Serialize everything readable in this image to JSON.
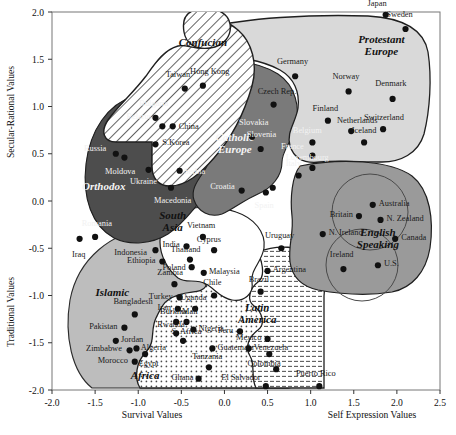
{
  "chart_data": {
    "type": "scatter",
    "title": "",
    "xlabel_left": "Survival Values",
    "xlabel_right": "Self Expression Values",
    "ylabel_top": "Secular-Rational Values",
    "ylabel_bottom": "Traditional Values",
    "xlim": [
      -2.0,
      2.5
    ],
    "ylim": [
      -2.0,
      2.0
    ],
    "xticks": [
      "-2.0",
      "-1.5",
      "-1.0",
      "-0.5",
      "0.0",
      "0.5",
      "1.0",
      "1.5",
      "2.0",
      "2.5"
    ],
    "xtick_values": [
      -2.0,
      -1.5,
      -1.0,
      -0.5,
      0.0,
      0.5,
      1.0,
      1.5,
      2.0,
      2.5
    ],
    "yticks": [
      "2.0",
      "1.5",
      "1.0",
      "0.5",
      "0.0",
      "-0.5",
      "-1.0",
      "-1.5",
      "-2.0"
    ],
    "ytick_values": [
      2.0,
      1.5,
      1.0,
      0.5,
      0.0,
      -0.5,
      -1.0,
      -1.5,
      -2.0
    ],
    "grid": false,
    "legend": "none",
    "groups": [
      {
        "name": "Confucian",
        "label_x": -0.25,
        "label_y": 1.64,
        "fill": "hatch",
        "label_color": "dark"
      },
      {
        "name": "Protestant Europe",
        "label_x": 1.82,
        "label_y": 1.62,
        "fill": "#d9d9d9",
        "label_color": "dark"
      },
      {
        "name": "Catholic Europe",
        "label_x": 0.12,
        "label_y": 0.58,
        "fill": "#7a7a7a",
        "label_color": "light"
      },
      {
        "name": "Orthodox",
        "label_x": -1.4,
        "label_y": 0.12,
        "fill": "#4d4d4d",
        "label_color": "light"
      },
      {
        "name": "English Speaking",
        "label_x": 1.78,
        "label_y": -0.42,
        "fill": "#9a9a9a",
        "label_color": "dark"
      },
      {
        "name": "South Asia",
        "label_x": -0.6,
        "label_y": -0.24,
        "fill": "#ffffff",
        "label_color": "dark"
      },
      {
        "name": "Islamic",
        "label_x": -1.3,
        "label_y": -1.0,
        "fill": "#bdbdbd",
        "label_color": "dark"
      },
      {
        "name": "Latin America",
        "label_x": 0.38,
        "label_y": -1.22,
        "fill": "#efefef",
        "label_color": "dark"
      },
      {
        "name": "Africa",
        "label_x": -0.92,
        "label_y": -1.88,
        "fill": "#e5e5e5",
        "label_color": "dark"
      }
    ],
    "points": [
      {
        "country": "Japan",
        "x": 1.87,
        "y": 1.97,
        "lx": -0.1,
        "ly": 0.13,
        "anchor": "middle",
        "color": "dark"
      },
      {
        "country": "Sweden",
        "x": 2.1,
        "y": 1.82,
        "lx": -0.07,
        "ly": 0.16,
        "anchor": "middle",
        "color": "dark"
      },
      {
        "country": "Taiwan",
        "x": -0.46,
        "y": 1.19,
        "lx": -0.08,
        "ly": 0.16,
        "anchor": "middle",
        "color": "dark"
      },
      {
        "country": "Hong Kong",
        "x": -0.25,
        "y": 1.22,
        "lx": 0.08,
        "ly": 0.16,
        "anchor": "middle",
        "color": "dark"
      },
      {
        "country": "Germany",
        "x": 0.82,
        "y": 1.32,
        "lx": -0.03,
        "ly": 0.16,
        "anchor": "middle",
        "color": "dark"
      },
      {
        "country": "Norway",
        "x": 1.44,
        "y": 1.16,
        "lx": -0.03,
        "ly": 0.16,
        "anchor": "middle",
        "color": "dark"
      },
      {
        "country": "Denmark",
        "x": 1.95,
        "y": 1.08,
        "lx": -0.02,
        "ly": 0.17,
        "anchor": "middle",
        "color": "dark"
      },
      {
        "country": "Czech Rep.",
        "x": 0.57,
        "y": 1.02,
        "lx": 0.04,
        "ly": 0.14,
        "anchor": "middle",
        "color": "dark"
      },
      {
        "country": "Bulgaria",
        "x": -0.8,
        "y": 0.88,
        "lx": -0.02,
        "ly": 0.16,
        "anchor": "middle",
        "color": "light"
      },
      {
        "country": "Belarus",
        "x": -0.72,
        "y": 0.79,
        "lx": -0.12,
        "ly": 0.11,
        "anchor": "end",
        "color": "light"
      },
      {
        "country": "China",
        "x": -0.6,
        "y": 0.79,
        "lx": 0.07,
        "ly": 0.0,
        "anchor": "start",
        "color": "dark"
      },
      {
        "country": "Slovakia",
        "x": 0.32,
        "y": 0.68,
        "lx": 0.02,
        "ly": 0.16,
        "anchor": "middle",
        "color": "light"
      },
      {
        "country": "Slovenia",
        "x": 0.42,
        "y": 0.55,
        "lx": 0.01,
        "ly": 0.16,
        "anchor": "middle",
        "color": "light"
      },
      {
        "country": "Finland",
        "x": 1.2,
        "y": 0.85,
        "lx": -0.03,
        "ly": 0.14,
        "anchor": "middle",
        "color": "dark"
      },
      {
        "country": "Netherlands",
        "x": 1.47,
        "y": 0.74,
        "lx": 0.07,
        "ly": 0.12,
        "anchor": "middle",
        "color": "dark"
      },
      {
        "country": "Switzerland",
        "x": 1.84,
        "y": 0.76,
        "lx": 0.01,
        "ly": 0.13,
        "anchor": "middle",
        "color": "dark"
      },
      {
        "country": "Iceland",
        "x": 1.62,
        "y": 0.62,
        "lx": 0.0,
        "ly": 0.13,
        "anchor": "middle",
        "color": "dark"
      },
      {
        "country": "Belgium",
        "x": 1.02,
        "y": 0.62,
        "lx": -0.06,
        "ly": 0.13,
        "anchor": "middle",
        "color": "light"
      },
      {
        "country": "France",
        "x": 1.02,
        "y": 0.48,
        "lx": -0.1,
        "ly": 0.1,
        "anchor": "end",
        "color": "light"
      },
      {
        "country": "Luxembourg",
        "x": 1.02,
        "y": 0.35,
        "lx": -0.06,
        "ly": 0.12,
        "anchor": "middle",
        "color": "light"
      },
      {
        "country": "Russia",
        "x": -1.26,
        "y": 0.5,
        "lx": -0.11,
        "ly": 0.06,
        "anchor": "end",
        "color": "light"
      },
      {
        "country": "S.Korea",
        "x": -0.8,
        "y": 0.6,
        "lx": 0.08,
        "ly": 0.02,
        "anchor": "start",
        "color": "dark"
      },
      {
        "country": "Moldova",
        "x": -1.16,
        "y": 0.46,
        "lx": -0.05,
        "ly": -0.14,
        "anchor": "middle",
        "color": "light"
      },
      {
        "country": "Ukraine",
        "x": -0.88,
        "y": 0.33,
        "lx": -0.06,
        "ly": -0.12,
        "anchor": "middle",
        "color": "light"
      },
      {
        "country": "Serbia",
        "x": -0.52,
        "y": 0.32,
        "lx": 0.05,
        "ly": 0.0,
        "anchor": "start",
        "color": "light"
      },
      {
        "country": "Macedonia",
        "x": -0.62,
        "y": 0.14,
        "lx": 0.02,
        "ly": -0.13,
        "anchor": "middle",
        "color": "light"
      },
      {
        "country": "Italy",
        "x": 0.86,
        "y": 0.27,
        "lx": -0.06,
        "ly": 0.13,
        "anchor": "middle",
        "color": "light"
      },
      {
        "country": "Croatia",
        "x": 0.2,
        "y": 0.11,
        "lx": -0.08,
        "ly": 0.05,
        "anchor": "end",
        "color": "light"
      },
      {
        "country": "Spain",
        "x": 0.48,
        "y": 0.09,
        "lx": -0.02,
        "ly": -0.13,
        "anchor": "middle",
        "color": "light"
      },
      {
        "country": "Spain2",
        "x": 0.56,
        "y": 0.14,
        "lx": 0.0,
        "ly": 0.0,
        "anchor": "middle",
        "color": "none"
      },
      {
        "country": "Britain",
        "x": 1.56,
        "y": -0.16,
        "lx": -0.07,
        "ly": 0.02,
        "anchor": "end",
        "color": "dark"
      },
      {
        "country": "Australia",
        "x": 1.72,
        "y": -0.04,
        "lx": 0.07,
        "ly": 0.02,
        "anchor": "start",
        "color": "dark"
      },
      {
        "country": "N. Zealand",
        "x": 1.81,
        "y": -0.2,
        "lx": 0.07,
        "ly": 0.02,
        "anchor": "start",
        "color": "dark"
      },
      {
        "country": "Canada",
        "x": 1.98,
        "y": -0.4,
        "lx": 0.07,
        "ly": 0.02,
        "anchor": "start",
        "color": "dark"
      },
      {
        "country": "N. Ireland",
        "x": 1.14,
        "y": -0.35,
        "lx": 0.07,
        "ly": 0.02,
        "anchor": "start",
        "color": "dark"
      },
      {
        "country": "Ireland",
        "x": 1.38,
        "y": -0.72,
        "lx": -0.02,
        "ly": 0.16,
        "anchor": "middle",
        "color": "dark"
      },
      {
        "country": "U.S.",
        "x": 1.78,
        "y": -0.68,
        "lx": 0.07,
        "ly": 0.02,
        "anchor": "start",
        "color": "dark"
      },
      {
        "country": "Romania",
        "x": -1.5,
        "y": -0.38,
        "lx": 0.02,
        "ly": 0.15,
        "anchor": "middle",
        "color": "light"
      },
      {
        "country": "Iraq",
        "x": -1.68,
        "y": -0.4,
        "lx": -0.01,
        "ly": -0.16,
        "anchor": "middle",
        "color": "dark"
      },
      {
        "country": "Vietnam",
        "x": -0.25,
        "y": -0.38,
        "lx": -0.02,
        "ly": 0.13,
        "anchor": "middle",
        "color": "dark"
      },
      {
        "country": "India",
        "x": -0.44,
        "y": -0.48,
        "lx": -0.08,
        "ly": 0.02,
        "anchor": "end",
        "color": "dark"
      },
      {
        "country": "Cyprus",
        "x": -0.12,
        "y": -0.52,
        "lx": -0.06,
        "ly": 0.12,
        "anchor": "middle",
        "color": "dark"
      },
      {
        "country": "Uruguay",
        "x": 0.66,
        "y": -0.5,
        "lx": -0.02,
        "ly": 0.14,
        "anchor": "middle",
        "color": "dark"
      },
      {
        "country": "Indonesia",
        "x": -0.8,
        "y": -0.52,
        "lx": -0.1,
        "ly": -0.02,
        "anchor": "end",
        "color": "dark"
      },
      {
        "country": "Thailand",
        "x": -0.4,
        "y": -0.62,
        "lx": -0.05,
        "ly": 0.11,
        "anchor": "middle",
        "color": "dark"
      },
      {
        "country": "Poland",
        "x": -0.38,
        "y": -0.7,
        "lx": -0.07,
        "ly": 0.0,
        "anchor": "end",
        "color": "dark"
      },
      {
        "country": "Ethiopia",
        "x": -0.72,
        "y": -0.64,
        "lx": -0.08,
        "ly": 0.02,
        "anchor": "end",
        "color": "dark"
      },
      {
        "country": "Malaysia",
        "x": -0.24,
        "y": -0.76,
        "lx": 0.06,
        "ly": 0.02,
        "anchor": "start",
        "color": "dark"
      },
      {
        "country": "Argentina",
        "x": 0.5,
        "y": -0.74,
        "lx": 0.06,
        "ly": 0.02,
        "anchor": "start",
        "color": "dark"
      },
      {
        "country": "Zambia",
        "x": -0.58,
        "y": -0.88,
        "lx": -0.05,
        "ly": 0.13,
        "anchor": "middle",
        "color": "dark"
      },
      {
        "country": "Turkey",
        "x": -0.52,
        "y": -1.02,
        "lx": -0.08,
        "ly": 0.02,
        "anchor": "end",
        "color": "dark"
      },
      {
        "country": "Chile",
        "x": -0.12,
        "y": -1.0,
        "lx": -0.02,
        "ly": 0.14,
        "anchor": "middle",
        "color": "dark"
      },
      {
        "country": "Brazil",
        "x": 0.42,
        "y": -0.96,
        "lx": -0.02,
        "ly": 0.14,
        "anchor": "middle",
        "color": "dark"
      },
      {
        "country": "Iran",
        "x": -0.54,
        "y": -1.14,
        "lx": -0.08,
        "ly": 0.02,
        "anchor": "end",
        "color": "dark"
      },
      {
        "country": "Bangladesh",
        "x": -1.04,
        "y": -1.2,
        "lx": -0.02,
        "ly": 0.14,
        "anchor": "middle",
        "color": "dark"
      },
      {
        "country": "Uganda",
        "x": -0.34,
        "y": -1.14,
        "lx": -0.02,
        "ly": 0.13,
        "anchor": "middle",
        "color": "dark"
      },
      {
        "country": "Burkina",
        "x": -0.56,
        "y": -1.28,
        "lx": -0.03,
        "ly": 0.12,
        "anchor": "middle",
        "color": "dark"
      },
      {
        "country": "Mali",
        "x": -0.44,
        "y": -1.28,
        "lx": 0.04,
        "ly": 0.12,
        "anchor": "middle",
        "color": "dark"
      },
      {
        "country": "Pakistan",
        "x": -1.16,
        "y": -1.34,
        "lx": -0.08,
        "ly": 0.02,
        "anchor": "end",
        "color": "dark"
      },
      {
        "country": "Rwanda",
        "x": -0.56,
        "y": -1.4,
        "lx": -0.06,
        "ly": 0.1,
        "anchor": "middle",
        "color": "dark"
      },
      {
        "country": "Nigeria",
        "x": -0.36,
        "y": -1.36,
        "lx": 0.06,
        "ly": 0.02,
        "anchor": "start",
        "color": "dark"
      },
      {
        "country": "S. Africa",
        "x": -0.48,
        "y": -1.48,
        "lx": 0.04,
        "ly": 0.1,
        "anchor": "middle",
        "color": "dark"
      },
      {
        "country": "Jordan",
        "x": -1.26,
        "y": -1.48,
        "lx": 0.06,
        "ly": 0.02,
        "anchor": "start",
        "color": "dark"
      },
      {
        "country": "Zimbabwe",
        "x": -1.1,
        "y": -1.58,
        "lx": -0.09,
        "ly": 0.02,
        "anchor": "end",
        "color": "dark"
      },
      {
        "country": "Algeria",
        "x": -1.02,
        "y": -1.56,
        "lx": 0.05,
        "ly": 0.02,
        "anchor": "start",
        "color": "dark"
      },
      {
        "country": "Egypt",
        "x": -0.92,
        "y": -1.62,
        "lx": 0.04,
        "ly": -0.1,
        "anchor": "middle",
        "color": "dark"
      },
      {
        "country": "Morocco",
        "x": -1.04,
        "y": -1.7,
        "lx": -0.08,
        "ly": 0.02,
        "anchor": "end",
        "color": "dark"
      },
      {
        "country": "Peru",
        "x": 0.18,
        "y": -1.38,
        "lx": -0.08,
        "ly": 0.02,
        "anchor": "end",
        "color": "dark"
      },
      {
        "country": "Guatemala",
        "x": -0.14,
        "y": -1.56,
        "lx": 0.06,
        "ly": 0.02,
        "anchor": "start",
        "color": "dark"
      },
      {
        "country": "Mexico",
        "x": 0.5,
        "y": -1.46,
        "lx": -0.07,
        "ly": 0.02,
        "anchor": "end",
        "color": "dark"
      },
      {
        "country": "Venezuela",
        "x": 0.28,
        "y": -1.56,
        "lx": 0.06,
        "ly": 0.02,
        "anchor": "start",
        "color": "dark"
      },
      {
        "country": "Colombia",
        "x": 0.52,
        "y": -1.62,
        "lx": -0.06,
        "ly": -0.09,
        "anchor": "middle",
        "color": "dark"
      },
      {
        "country": "Tanzania",
        "x": -0.18,
        "y": -1.76,
        "lx": -0.02,
        "ly": 0.12,
        "anchor": "middle",
        "color": "dark"
      },
      {
        "country": "Ghana",
        "x": -0.3,
        "y": -1.88,
        "lx": -0.06,
        "ly": 0.02,
        "anchor": "end",
        "color": "dark"
      },
      {
        "country": "El Salvador",
        "x": 0.48,
        "y": -1.96,
        "lx": -0.06,
        "ly": 0.1,
        "anchor": "end",
        "color": "dark"
      },
      {
        "country": "Puerto Rico",
        "x": 1.1,
        "y": -1.96,
        "lx": -0.04,
        "ly": 0.14,
        "anchor": "middle",
        "color": "dark"
      },
      {
        "country": "Puerto Rico2",
        "x": 0.6,
        "y": -1.78,
        "lx": 0.0,
        "ly": 0.0,
        "anchor": "middle",
        "color": "none"
      }
    ]
  },
  "axes": {
    "y_top_label": "Secular-Rational Values",
    "y_bottom_label": "Traditional Values",
    "x_left_label": "Survival Values",
    "x_right_label": "Self Expression Values"
  },
  "colors": {
    "confucian": "#ffffff",
    "protestant": "#d9d9d9",
    "catholic": "#7a7a7a",
    "orthodox": "#4d4d4d",
    "english": "#9a9a9a",
    "south_asia": "#ffffff",
    "islamic": "#bdbdbd",
    "latin": "#efefef",
    "africa": "#e8e8e8",
    "point": "#111111",
    "frame": "#6b6b6b"
  }
}
